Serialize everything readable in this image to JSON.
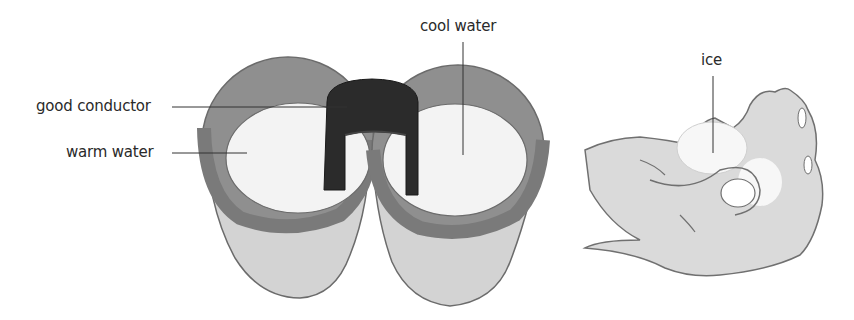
{
  "diagram": {
    "panels": [
      {
        "id": "cups",
        "description": "Two cups of water joined by a metal strip",
        "labels": {
          "good_conductor": "good conductor",
          "warm_water": "warm water",
          "cool_water": "cool water"
        }
      },
      {
        "id": "hand",
        "description": "Hand holding ice",
        "labels": {
          "ice": "ice"
        }
      }
    ],
    "colors": {
      "cup_rim": "#8a8a8a",
      "cup_body": "#d2d2d2",
      "cup_outline": "#6b6b6b",
      "water": "#f4f4f4",
      "conductor": "#2b2b2b",
      "hand_fill": "#d9d9d9",
      "hand_outline": "#707070",
      "ice": "#f7f7f7",
      "leader_line": "#333333",
      "text": "#2a2a2a"
    }
  }
}
